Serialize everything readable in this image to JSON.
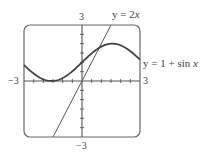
{
  "chart_data": {
    "type": "line",
    "title": "",
    "xlabel": "",
    "ylabel": "",
    "xlim": [
      -3,
      3
    ],
    "ylim": [
      -3,
      3
    ],
    "grid": false,
    "tick_spacing": 0.5,
    "tick_labels": {
      "x_min": "−3",
      "x_max": "3",
      "y_min": "−3",
      "y_max": "3"
    },
    "series": [
      {
        "name": "y = 1 + sin x",
        "label_prefix": "y = 1 + sin ",
        "label_var": "x",
        "function": "1 + sin(x)",
        "x": [
          -3,
          -2.5,
          -2,
          -1.5708,
          -1,
          -0.5,
          0,
          0.5,
          1,
          1.5708,
          2,
          2.5,
          3
        ],
        "values": [
          0.859,
          0.402,
          0.091,
          0,
          0.159,
          0.521,
          1,
          1.479,
          1.841,
          2,
          1.909,
          1.598,
          1.141
        ]
      },
      {
        "name": "y = 2x",
        "label_prefix": "y = 2",
        "label_var": "x",
        "function": "2x",
        "x": [
          -1.5,
          0,
          1.5
        ],
        "values": [
          -3,
          0,
          3
        ]
      }
    ],
    "annotations": [
      "y = 2x",
      "y = 1 + sin x"
    ]
  },
  "colors": {
    "frame": "#555555",
    "axes": "#555555",
    "curve": "#444444",
    "line": "#555555"
  }
}
